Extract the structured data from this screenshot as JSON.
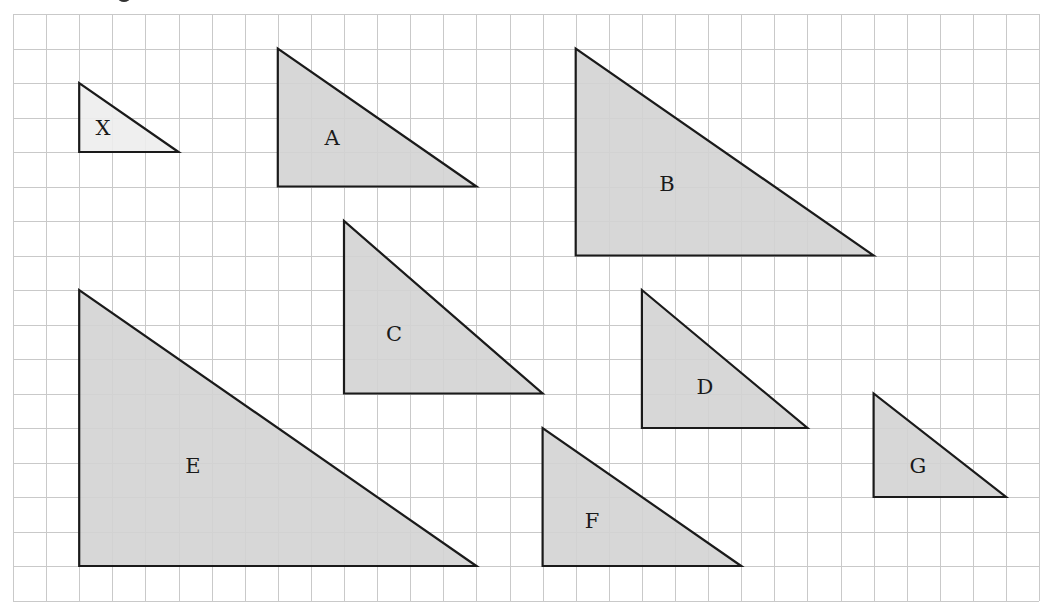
{
  "diagram": {
    "type": "grid-of-right-triangles",
    "grid": {
      "columns": 31,
      "rows": 17,
      "origin_x": 13,
      "origin_y": 14,
      "cell_w": 33.1,
      "cell_h": 34.5,
      "line_color": "#c9c9c9",
      "background": "#ffffff"
    },
    "colors": {
      "reference_fill": "#ededed",
      "shape_fill": "#d3d3d3",
      "outline": "#1a1a1a",
      "label": "#1a1a1a"
    },
    "triangles": [
      {
        "label": "X",
        "col": 2,
        "row": 2,
        "width": 3,
        "height": 2,
        "reference": true,
        "label_x": 103,
        "label_y": 128
      },
      {
        "label": "A",
        "col": 8,
        "row": 1,
        "width": 6,
        "height": 4,
        "reference": false,
        "label_x": 332,
        "label_y": 138
      },
      {
        "label": "B",
        "col": 17,
        "row": 1,
        "width": 9,
        "height": 6,
        "reference": false,
        "label_x": 667,
        "label_y": 184
      },
      {
        "label": "C",
        "col": 10,
        "row": 6,
        "width": 6,
        "height": 5,
        "reference": false,
        "label_x": 394,
        "label_y": 334
      },
      {
        "label": "D",
        "col": 19,
        "row": 8,
        "width": 5,
        "height": 4,
        "reference": false,
        "label_x": 705,
        "label_y": 387
      },
      {
        "label": "E",
        "col": 2,
        "row": 8,
        "width": 12,
        "height": 8,
        "reference": false,
        "label_x": 193,
        "label_y": 466
      },
      {
        "label": "F",
        "col": 16,
        "row": 12,
        "width": 6,
        "height": 4,
        "reference": false,
        "label_x": 592,
        "label_y": 521
      },
      {
        "label": "G",
        "col": 26,
        "row": 11,
        "width": 4,
        "height": 3,
        "reference": false,
        "label_x": 918,
        "label_y": 466
      }
    ]
  }
}
